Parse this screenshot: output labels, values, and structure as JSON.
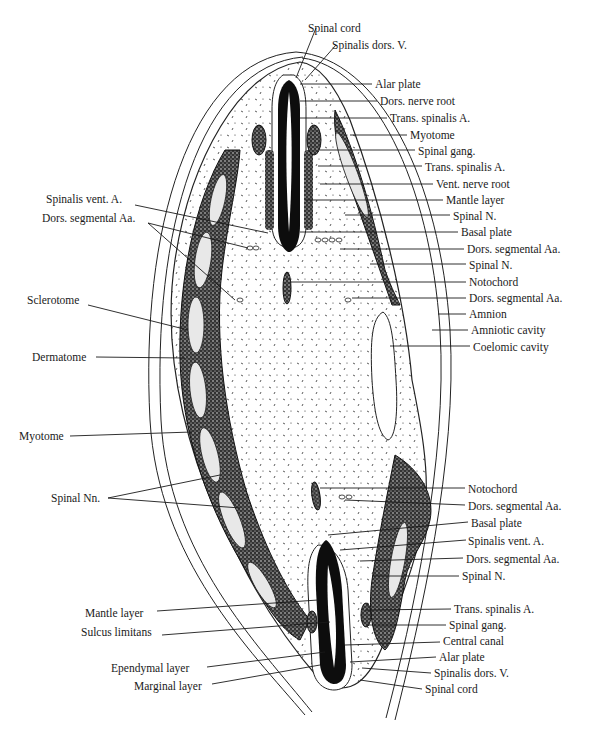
{
  "figure": {
    "type": "embryo transverse section diagram",
    "labels_right_top": [
      {
        "id": "spinal-cord-top",
        "text": "Spinal cord",
        "x": 308,
        "y": 22
      },
      {
        "id": "spinalis-dors-v-top",
        "text": "Spinalis dors. V.",
        "x": 332,
        "y": 39
      },
      {
        "id": "alar-plate-top",
        "text": "Alar plate",
        "x": 375,
        "y": 78
      },
      {
        "id": "dors-nerve-root",
        "text": "Dors. nerve root",
        "x": 380,
        "y": 95
      },
      {
        "id": "trans-spinalis-a-1",
        "text": "Trans. spinalis A.",
        "x": 390,
        "y": 112
      },
      {
        "id": "myotome-right",
        "text": "Myotome",
        "x": 410,
        "y": 129
      },
      {
        "id": "spinal-gang-top",
        "text": "Spinal gang.",
        "x": 418,
        "y": 145
      },
      {
        "id": "trans-spinalis-a-2",
        "text": "Trans. spinalis A.",
        "x": 425,
        "y": 161
      },
      {
        "id": "vent-nerve-root",
        "text": "Vent. nerve root",
        "x": 436,
        "y": 178
      },
      {
        "id": "mantle-layer-top",
        "text": "Mantle layer",
        "x": 446,
        "y": 194
      },
      {
        "id": "spinal-n-1",
        "text": "Spinal N.",
        "x": 453,
        "y": 210
      },
      {
        "id": "basal-plate-top",
        "text": "Basal plate",
        "x": 461,
        "y": 226
      },
      {
        "id": "dors-segmental-aa-1",
        "text": "Dors. segmental Aa.",
        "x": 467,
        "y": 243
      },
      {
        "id": "spinal-n-2",
        "text": "Spinal N.",
        "x": 469,
        "y": 259
      },
      {
        "id": "notochord-top",
        "text": "Notochord",
        "x": 469,
        "y": 276
      },
      {
        "id": "dors-segmental-aa-2",
        "text": "Dors. segmental Aa.",
        "x": 469,
        "y": 292
      },
      {
        "id": "amnion",
        "text": "Amnion",
        "x": 469,
        "y": 308
      },
      {
        "id": "amniotic-cavity",
        "text": "Amniotic cavity",
        "x": 471,
        "y": 324
      },
      {
        "id": "coelomic-cavity",
        "text": "Coelomic cavity",
        "x": 473,
        "y": 341
      }
    ],
    "labels_left_top": [
      {
        "id": "spinalis-vent-a-left",
        "text": "Spinalis vent. A.",
        "x": 46,
        "y": 193
      },
      {
        "id": "dors-segmental-aa-left",
        "text": "Dors. segmental Aa.",
        "x": 42,
        "y": 212
      },
      {
        "id": "sclerotome",
        "text": "Sclerotome",
        "x": 27,
        "y": 294
      },
      {
        "id": "dermatome",
        "text": "Dermatome",
        "x": 32,
        "y": 351
      },
      {
        "id": "myotome-left",
        "text": "Myotome",
        "x": 19,
        "y": 430
      }
    ],
    "labels_left_bottom": [
      {
        "id": "spinal-nn",
        "text": "Spinal Nn.",
        "x": 51,
        "y": 492
      },
      {
        "id": "mantle-layer-bottom",
        "text": "Mantle layer",
        "x": 85,
        "y": 607
      },
      {
        "id": "sulcus-limitans",
        "text": "Sulcus limitans",
        "x": 81,
        "y": 626
      },
      {
        "id": "ependymal-layer",
        "text": "Ependymal layer",
        "x": 111,
        "y": 662
      },
      {
        "id": "marginal-layer",
        "text": "Marginal layer",
        "x": 134,
        "y": 680
      }
    ],
    "labels_right_bottom": [
      {
        "id": "notochord-bottom",
        "text": "Notochord",
        "x": 468,
        "y": 483
      },
      {
        "id": "dors-segmental-aa-3",
        "text": "Dors. segmental Aa.",
        "x": 468,
        "y": 500
      },
      {
        "id": "basal-plate-bottom",
        "text": "Basal plate",
        "x": 471,
        "y": 517
      },
      {
        "id": "spinalis-vent-a-right",
        "text": "Spinalis vent. A.",
        "x": 468,
        "y": 535
      },
      {
        "id": "dors-segmental-aa-4",
        "text": "Dors. segmental Aa.",
        "x": 466,
        "y": 553
      },
      {
        "id": "spinal-n-3",
        "text": "Spinal N.",
        "x": 462,
        "y": 570
      },
      {
        "id": "trans-spinalis-a-3",
        "text": "Trans. spinalis A.",
        "x": 454,
        "y": 603
      },
      {
        "id": "spinal-gang-bottom",
        "text": "Spinal gang.",
        "x": 449,
        "y": 619
      },
      {
        "id": "central-canal",
        "text": "Central canal",
        "x": 443,
        "y": 635
      },
      {
        "id": "alar-plate-bottom",
        "text": "Alar plate",
        "x": 439,
        "y": 651
      },
      {
        "id": "spinalis-dors-v-bottom",
        "text": "Spinalis dors. V.",
        "x": 434,
        "y": 667
      },
      {
        "id": "spinal-cord-bottom",
        "text": "Spinal cord",
        "x": 425,
        "y": 683
      }
    ],
    "colors": {
      "ink": "#1a1a1a",
      "paper": "#ffffff"
    }
  }
}
